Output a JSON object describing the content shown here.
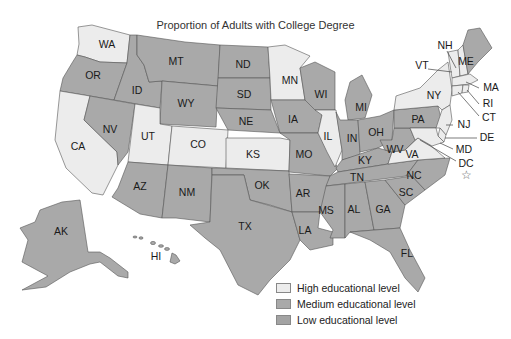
{
  "title": "Proportion of Adults with College Degree",
  "colors": {
    "high": "#ececec",
    "medium": "#a9a9a9",
    "low": "#a3a3a3",
    "border": "#555555"
  },
  "legend": [
    {
      "key": "high",
      "label": "High educational level"
    },
    {
      "key": "medium",
      "label": "Medium educational level"
    },
    {
      "key": "low",
      "label": "Low educational level"
    }
  ],
  "states": {
    "high": [
      "WA",
      "CA",
      "UT",
      "CO",
      "KS",
      "MN",
      "IL",
      "NY",
      "VT",
      "NH",
      "MA",
      "RI",
      "CT",
      "NJ",
      "MD",
      "DE",
      "VA",
      "DC"
    ],
    "other": [
      "OR",
      "ID",
      "NV",
      "MT",
      "WY",
      "AZ",
      "NM",
      "ND",
      "SD",
      "NE",
      "OK",
      "TX",
      "IA",
      "MO",
      "AR",
      "LA",
      "WI",
      "MI",
      "IN",
      "OH",
      "KY",
      "TN",
      "MS",
      "AL",
      "GA",
      "FL",
      "SC",
      "NC",
      "WV",
      "PA",
      "ME",
      "AK",
      "HI"
    ]
  },
  "labels": {
    "WA": "WA",
    "OR": "OR",
    "CA": "CA",
    "ID": "ID",
    "NV": "NV",
    "MT": "MT",
    "WY": "WY",
    "UT": "UT",
    "CO": "CO",
    "AZ": "AZ",
    "NM": "NM",
    "ND": "ND",
    "SD": "SD",
    "NE": "NE",
    "KS": "KS",
    "OK": "OK",
    "TX": "TX",
    "MN": "MN",
    "IA": "IA",
    "MO": "MO",
    "AR": "AR",
    "LA": "LA",
    "WI": "WI",
    "IL": "IL",
    "MI": "MI",
    "IN": "IN",
    "OH": "OH",
    "KY": "KY",
    "TN": "TN",
    "MS": "MS",
    "AL": "AL",
    "GA": "GA",
    "FL": "FL",
    "SC": "SC",
    "NC": "NC",
    "VA": "VA",
    "WV": "WV",
    "PA": "PA",
    "NY": "NY",
    "VT": "VT",
    "NH": "NH",
    "ME": "ME",
    "MA": "MA",
    "RI": "RI",
    "CT": "CT",
    "NJ": "NJ",
    "DE": "DE",
    "MD": "MD",
    "DC": "DC",
    "AK": "AK",
    "HI": "HI"
  },
  "dc_marker": "☆"
}
